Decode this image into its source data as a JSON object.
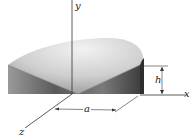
{
  "figure": {
    "axes": {
      "x_label": "x",
      "y_label": "y",
      "z_label": "z"
    },
    "dimensions": {
      "radius_label": "a",
      "height_label": "h"
    },
    "colors": {
      "background": "#ffffff",
      "line": "#333333",
      "solid_dark": "#4a4a4a",
      "solid_light": "#e8e8e8"
    }
  }
}
